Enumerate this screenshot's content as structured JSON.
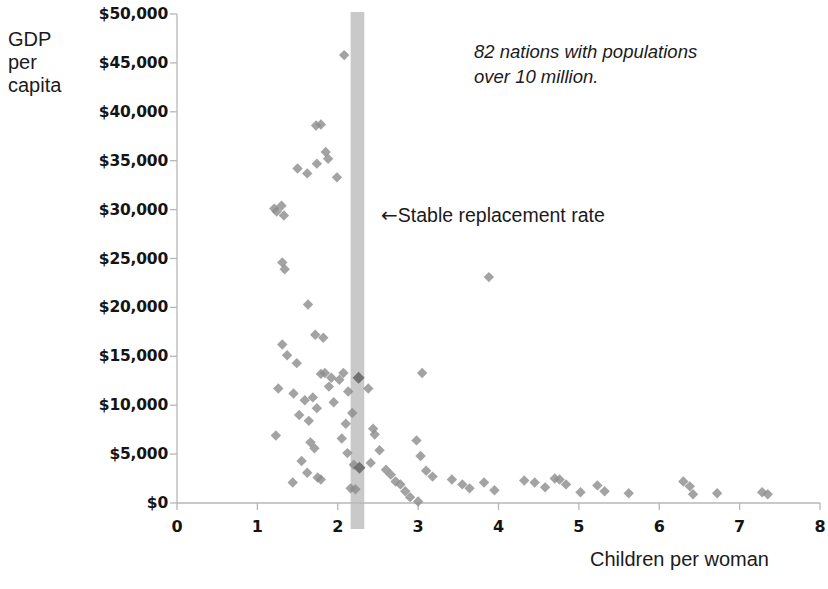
{
  "chart_data": {
    "type": "scatter",
    "title": "",
    "xlabel": "Children per woman",
    "ylabel_lines": [
      "GDP",
      "per",
      "capita"
    ],
    "xlim": [
      0,
      8
    ],
    "ylim": [
      0,
      50000
    ],
    "xticks": [
      0,
      1,
      2,
      3,
      4,
      5,
      6,
      7,
      8
    ],
    "xtick_labels": [
      "0",
      "1",
      "2",
      "3",
      "4",
      "5",
      "6",
      "7",
      "8"
    ],
    "yticks": [
      0,
      5000,
      10000,
      15000,
      20000,
      25000,
      30000,
      35000,
      40000,
      45000,
      50000
    ],
    "ytick_labels": [
      "$0",
      "$5,000",
      "$10,000",
      "$15,000",
      "$20,000",
      "$25,000",
      "$30,000",
      "$35,000",
      "$40,000",
      "$45,000",
      "$50,000"
    ],
    "grid": false,
    "legend": null,
    "marker": "diamond",
    "marker_color": "#8c8c8c",
    "marker_highlight_color": "#6e6e6e",
    "annotations": [
      {
        "name": "sample-note",
        "lines": [
          "82 nations with populations",
          "over 10 million."
        ],
        "x": 3.85,
        "y": 46500,
        "style": "italic"
      },
      {
        "name": "stable-replacement-rate",
        "arrow": "←",
        "text": "Stable replacement rate",
        "x": 2.55,
        "y": 30000,
        "style": "normal"
      }
    ],
    "bands": [
      {
        "name": "stable-replacement-band",
        "orientation": "vertical",
        "x_start": 2.16,
        "x_end": 2.33,
        "color": "#bfbfbf"
      }
    ],
    "points": [
      {
        "x": 1.21,
        "y": 30100
      },
      {
        "x": 1.24,
        "y": 29800
      },
      {
        "x": 1.3,
        "y": 30400
      },
      {
        "x": 1.33,
        "y": 29400
      },
      {
        "x": 1.31,
        "y": 24600
      },
      {
        "x": 1.34,
        "y": 23900
      },
      {
        "x": 1.5,
        "y": 34200
      },
      {
        "x": 1.62,
        "y": 33700
      },
      {
        "x": 1.73,
        "y": 38600
      },
      {
        "x": 1.79,
        "y": 38700
      },
      {
        "x": 1.85,
        "y": 35900
      },
      {
        "x": 1.88,
        "y": 35200
      },
      {
        "x": 1.74,
        "y": 34700
      },
      {
        "x": 1.99,
        "y": 33300
      },
      {
        "x": 2.08,
        "y": 45800
      },
      {
        "x": 1.63,
        "y": 20300
      },
      {
        "x": 1.31,
        "y": 16200
      },
      {
        "x": 1.37,
        "y": 15100
      },
      {
        "x": 1.49,
        "y": 14300
      },
      {
        "x": 1.72,
        "y": 17200
      },
      {
        "x": 1.82,
        "y": 16900
      },
      {
        "x": 1.26,
        "y": 11700
      },
      {
        "x": 1.23,
        "y": 6900
      },
      {
        "x": 1.45,
        "y": 11200
      },
      {
        "x": 1.52,
        "y": 9000
      },
      {
        "x": 1.59,
        "y": 10500
      },
      {
        "x": 1.64,
        "y": 8400
      },
      {
        "x": 1.69,
        "y": 10800
      },
      {
        "x": 1.74,
        "y": 9700
      },
      {
        "x": 1.79,
        "y": 13200
      },
      {
        "x": 1.84,
        "y": 13300
      },
      {
        "x": 1.89,
        "y": 11900
      },
      {
        "x": 1.92,
        "y": 12800
      },
      {
        "x": 1.95,
        "y": 10300
      },
      {
        "x": 1.66,
        "y": 6200
      },
      {
        "x": 1.71,
        "y": 5600
      },
      {
        "x": 1.55,
        "y": 4300
      },
      {
        "x": 1.62,
        "y": 3100
      },
      {
        "x": 1.75,
        "y": 2600
      },
      {
        "x": 1.79,
        "y": 2400
      },
      {
        "x": 1.44,
        "y": 2100
      },
      {
        "x": 2.02,
        "y": 12600
      },
      {
        "x": 2.07,
        "y": 13300
      },
      {
        "x": 2.13,
        "y": 11400
      },
      {
        "x": 2.18,
        "y": 9200
      },
      {
        "x": 2.1,
        "y": 8100
      },
      {
        "x": 2.05,
        "y": 6600
      },
      {
        "x": 2.12,
        "y": 5100
      },
      {
        "x": 2.2,
        "y": 3900
      },
      {
        "x": 2.16,
        "y": 1500
      },
      {
        "x": 2.22,
        "y": 1400
      },
      {
        "x": 2.26,
        "y": 12800,
        "highlight": true
      },
      {
        "x": 2.27,
        "y": 3600,
        "highlight": true
      },
      {
        "x": 2.38,
        "y": 11700
      },
      {
        "x": 2.44,
        "y": 7600
      },
      {
        "x": 2.46,
        "y": 7000
      },
      {
        "x": 2.52,
        "y": 5400
      },
      {
        "x": 2.41,
        "y": 4100
      },
      {
        "x": 2.6,
        "y": 3400
      },
      {
        "x": 2.66,
        "y": 2900
      },
      {
        "x": 2.72,
        "y": 2200
      },
      {
        "x": 2.78,
        "y": 1900
      },
      {
        "x": 2.84,
        "y": 1200
      },
      {
        "x": 2.9,
        "y": 600
      },
      {
        "x": 2.98,
        "y": 6400
      },
      {
        "x": 3.03,
        "y": 4800
      },
      {
        "x": 3.1,
        "y": 3300
      },
      {
        "x": 3.18,
        "y": 2700
      },
      {
        "x": 3.0,
        "y": 150
      },
      {
        "x": 3.05,
        "y": 13300
      },
      {
        "x": 3.42,
        "y": 2400
      },
      {
        "x": 3.55,
        "y": 1900
      },
      {
        "x": 3.64,
        "y": 1500
      },
      {
        "x": 3.88,
        "y": 23100
      },
      {
        "x": 3.82,
        "y": 2100
      },
      {
        "x": 3.95,
        "y": 1300
      },
      {
        "x": 4.32,
        "y": 2300
      },
      {
        "x": 4.45,
        "y": 2100
      },
      {
        "x": 4.58,
        "y": 1600
      },
      {
        "x": 4.7,
        "y": 2500
      },
      {
        "x": 4.76,
        "y": 2400
      },
      {
        "x": 4.84,
        "y": 1900
      },
      {
        "x": 5.02,
        "y": 1100
      },
      {
        "x": 5.23,
        "y": 1800
      },
      {
        "x": 5.32,
        "y": 1200
      },
      {
        "x": 5.62,
        "y": 1000
      },
      {
        "x": 6.3,
        "y": 2200
      },
      {
        "x": 6.38,
        "y": 1700
      },
      {
        "x": 6.42,
        "y": 900
      },
      {
        "x": 6.72,
        "y": 1000
      },
      {
        "x": 7.28,
        "y": 1100
      },
      {
        "x": 7.35,
        "y": 900
      }
    ]
  },
  "colors": {
    "axis_line": "#b7b7b7",
    "marker": "#8c8c8c",
    "marker_highlight": "#6e6e6e",
    "band": "#bfbfbf",
    "text": "#1b1b1b"
  }
}
